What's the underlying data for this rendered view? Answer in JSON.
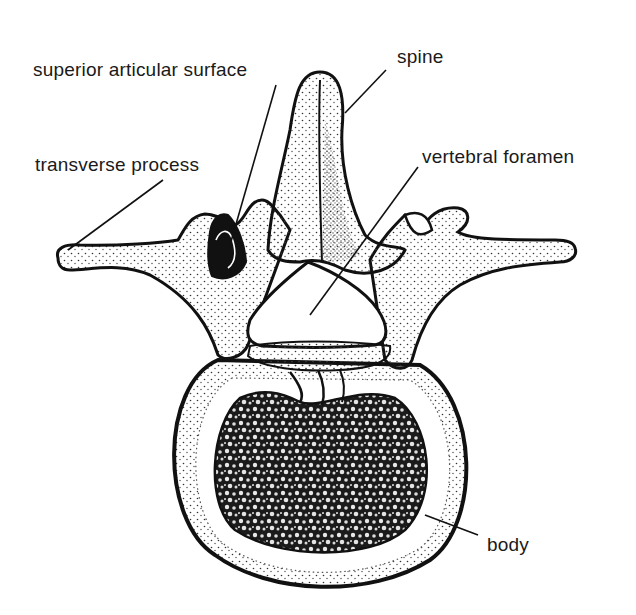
{
  "figure": {
    "colors": {
      "ink": "#111111",
      "bone": "#ffffff",
      "stipple": "#2a2a2a",
      "background": "#ffffff"
    }
  },
  "labels": [
    {
      "id": "superior-articular-surface",
      "text": "superior articular surface",
      "x": 33,
      "y": 60,
      "line": [
        276,
        85,
        228,
        252
      ]
    },
    {
      "id": "spine",
      "text": "spine",
      "x": 397,
      "y": 47,
      "line": [
        386,
        70,
        345,
        113
      ]
    },
    {
      "id": "transverse-process",
      "text": "transverse process",
      "x": 35,
      "y": 155,
      "line": [
        163,
        180,
        68,
        250
      ]
    },
    {
      "id": "vertebral-foramen",
      "text": "vertebral foramen",
      "x": 422,
      "y": 147,
      "line": [
        418,
        167,
        310,
        315
      ]
    },
    {
      "id": "body",
      "text": "body",
      "x": 487,
      "y": 535,
      "line": [
        425,
        515,
        478,
        535
      ]
    }
  ]
}
